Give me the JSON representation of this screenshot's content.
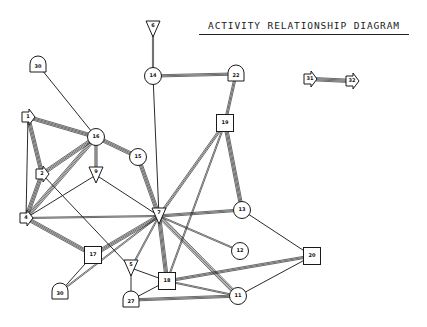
{
  "title": "ACTIVITY RELATIONSHIP DIAGRAM",
  "colors": {
    "line": "#2a2a2a",
    "background": "#ffffff",
    "node_fill": "#ffffff"
  },
  "nodes": [
    {
      "id": "6",
      "label": "6",
      "shape": "triangle-down",
      "x": 153,
      "y": 29
    },
    {
      "id": "14",
      "label": "14",
      "shape": "circle",
      "x": 153,
      "y": 76
    },
    {
      "id": "22",
      "label": "22",
      "shape": "dome",
      "x": 236,
      "y": 74
    },
    {
      "id": "30a",
      "label": "30",
      "shape": "dome",
      "x": 38,
      "y": 65
    },
    {
      "id": "19",
      "label": "19",
      "shape": "square",
      "x": 225,
      "y": 123
    },
    {
      "id": "1",
      "label": "1",
      "shape": "arrow-right",
      "x": 28,
      "y": 117
    },
    {
      "id": "16",
      "label": "16",
      "shape": "circle",
      "x": 96,
      "y": 137
    },
    {
      "id": "15",
      "label": "15",
      "shape": "circle",
      "x": 138,
      "y": 157
    },
    {
      "id": "2",
      "label": "2",
      "shape": "arrow-right",
      "x": 42,
      "y": 174
    },
    {
      "id": "9",
      "label": "9",
      "shape": "triangle-down",
      "x": 96,
      "y": 175
    },
    {
      "id": "4",
      "label": "4",
      "shape": "arrow-right",
      "x": 26,
      "y": 218
    },
    {
      "id": "7",
      "label": "7",
      "shape": "triangle-down",
      "x": 159,
      "y": 216
    },
    {
      "id": "13",
      "label": "13",
      "shape": "circle",
      "x": 242,
      "y": 210
    },
    {
      "id": "12",
      "label": "12",
      "shape": "circle",
      "x": 240,
      "y": 251
    },
    {
      "id": "17",
      "label": "17",
      "shape": "square",
      "x": 93,
      "y": 255
    },
    {
      "id": "5",
      "label": "5",
      "shape": "triangle-down",
      "x": 131,
      "y": 268
    },
    {
      "id": "18",
      "label": "18",
      "shape": "square",
      "x": 167,
      "y": 281
    },
    {
      "id": "20",
      "label": "20",
      "shape": "square",
      "x": 312,
      "y": 256
    },
    {
      "id": "30b",
      "label": "30",
      "shape": "dome",
      "x": 60,
      "y": 292
    },
    {
      "id": "27",
      "label": "27",
      "shape": "dome",
      "x": 131,
      "y": 300
    },
    {
      "id": "11",
      "label": "11",
      "shape": "circle",
      "x": 238,
      "y": 296
    },
    {
      "id": "31",
      "label": "31",
      "shape": "arrow-right",
      "x": 310,
      "y": 79
    },
    {
      "id": "32",
      "label": "32",
      "shape": "arrow-right",
      "x": 352,
      "y": 81
    }
  ],
  "edges": [
    {
      "from": "6",
      "to": "14",
      "weight": 2
    },
    {
      "from": "14",
      "to": "22",
      "weight": 3
    },
    {
      "from": "14",
      "to": "7",
      "weight": 1
    },
    {
      "from": "22",
      "to": "19",
      "weight": 3
    },
    {
      "from": "30a",
      "to": "16",
      "weight": 1
    },
    {
      "from": "1",
      "to": "16",
      "weight": 4
    },
    {
      "from": "1",
      "to": "2",
      "weight": 4
    },
    {
      "from": "1",
      "to": "4",
      "weight": 1
    },
    {
      "from": "16",
      "to": "2",
      "weight": 4
    },
    {
      "from": "16",
      "to": "9",
      "weight": 3
    },
    {
      "from": "16",
      "to": "15",
      "weight": 4
    },
    {
      "from": "16",
      "to": "4",
      "weight": 4
    },
    {
      "from": "15",
      "to": "7",
      "weight": 4
    },
    {
      "from": "2",
      "to": "4",
      "weight": 4
    },
    {
      "from": "2",
      "to": "5",
      "weight": 1
    },
    {
      "from": "9",
      "to": "4",
      "weight": 1
    },
    {
      "from": "9",
      "to": "7",
      "weight": 1
    },
    {
      "from": "4",
      "to": "7",
      "weight": 2
    },
    {
      "from": "4",
      "to": "17",
      "weight": 4
    },
    {
      "from": "19",
      "to": "7",
      "weight": 3
    },
    {
      "from": "19",
      "to": "13",
      "weight": 4
    },
    {
      "from": "19",
      "to": "18",
      "weight": 2
    },
    {
      "from": "7",
      "to": "13",
      "weight": 3
    },
    {
      "from": "7",
      "to": "12",
      "weight": 2
    },
    {
      "from": "7",
      "to": "17",
      "weight": 4
    },
    {
      "from": "7",
      "to": "30b",
      "weight": 2
    },
    {
      "from": "7",
      "to": "5",
      "weight": 2
    },
    {
      "from": "7",
      "to": "18",
      "weight": 4
    },
    {
      "from": "7",
      "to": "11",
      "weight": 4
    },
    {
      "from": "13",
      "to": "20",
      "weight": 1
    },
    {
      "from": "17",
      "to": "30b",
      "weight": 1
    },
    {
      "from": "5",
      "to": "27",
      "weight": 1
    },
    {
      "from": "5",
      "to": "18",
      "weight": 1
    },
    {
      "from": "18",
      "to": "20",
      "weight": 3
    },
    {
      "from": "18",
      "to": "27",
      "weight": 1
    },
    {
      "from": "18",
      "to": "11",
      "weight": 2
    },
    {
      "from": "27",
      "to": "11",
      "weight": 3
    },
    {
      "from": "11",
      "to": "20",
      "weight": 1
    },
    {
      "from": "31",
      "to": "32",
      "weight": 4
    }
  ]
}
